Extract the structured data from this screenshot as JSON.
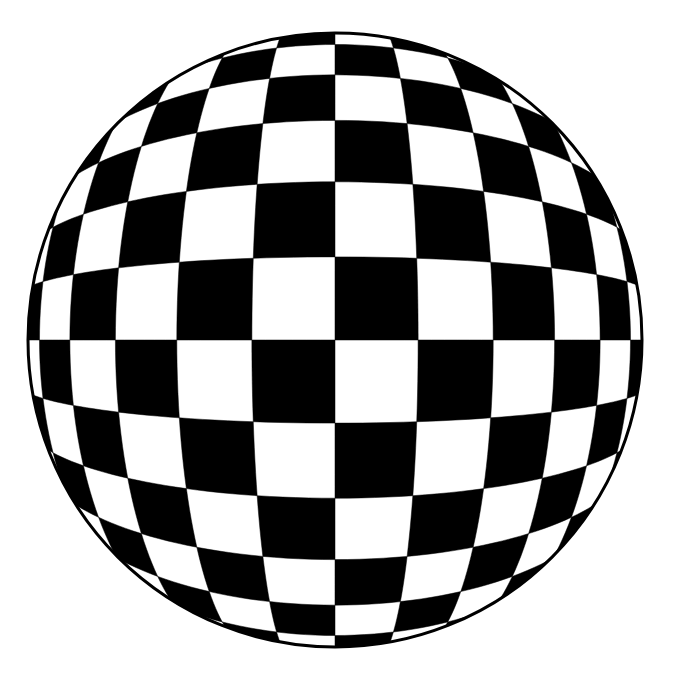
{
  "figure": {
    "title": "Distorted checkerboard test pattern",
    "type": "optical-test-chart",
    "canvas": {
      "width": 677,
      "height": 679,
      "background_color": "#ffffff"
    },
    "circle": {
      "center_x": 335,
      "center_y": 340,
      "radius": 307,
      "outline_color": "#000000",
      "outline_width": 3,
      "fill_color": "#ffffff"
    },
    "checker": {
      "columns": 12,
      "rows": 12,
      "dark_color": "#000000",
      "light_color": "#ffffff",
      "parity_offset": 0,
      "distortion_model": "pincushion",
      "distortion_k": 0.62,
      "half_extent": 1.0
    },
    "measured_column_edges_x": [
      28,
      123,
      192,
      249,
      297,
      335,
      375,
      428,
      487,
      555,
      642
    ],
    "measured_row_edges_y": [
      32,
      128,
      196,
      251,
      298,
      340,
      382,
      432,
      489,
      556,
      648
    ],
    "measured_center_cell_width": 40,
    "measured_edge_cell_width": 95
  },
  "chart_data": {
    "type": "heatmap",
    "title": "Distorted checkerboard test pattern",
    "xlabel": "",
    "ylabel": "",
    "categories": [
      "c1",
      "c2",
      "c3",
      "c4",
      "c5",
      "c6",
      "c7",
      "c8",
      "c9",
      "c10",
      "c11",
      "c12"
    ],
    "grid": true,
    "legend": "none",
    "values": [
      [
        0,
        1,
        0,
        1,
        0,
        1,
        0,
        1,
        0,
        1,
        0,
        1
      ],
      [
        1,
        0,
        1,
        0,
        1,
        0,
        1,
        0,
        1,
        0,
        1,
        0
      ],
      [
        0,
        1,
        0,
        1,
        0,
        1,
        0,
        1,
        0,
        1,
        0,
        1
      ],
      [
        1,
        0,
        1,
        0,
        1,
        0,
        1,
        0,
        1,
        0,
        1,
        0
      ],
      [
        0,
        1,
        0,
        1,
        0,
        1,
        0,
        1,
        0,
        1,
        0,
        1
      ],
      [
        1,
        0,
        1,
        0,
        1,
        0,
        1,
        0,
        1,
        0,
        1,
        0
      ],
      [
        0,
        1,
        0,
        1,
        0,
        1,
        0,
        1,
        0,
        1,
        0,
        1
      ],
      [
        1,
        0,
        1,
        0,
        1,
        0,
        1,
        0,
        1,
        0,
        1,
        0
      ],
      [
        0,
        1,
        0,
        1,
        0,
        1,
        0,
        1,
        0,
        1,
        0,
        1
      ],
      [
        1,
        0,
        1,
        0,
        1,
        0,
        1,
        0,
        1,
        0,
        1,
        0
      ],
      [
        0,
        1,
        0,
        1,
        0,
        1,
        0,
        1,
        0,
        1,
        0,
        1
      ],
      [
        1,
        0,
        1,
        0,
        1,
        0,
        1,
        0,
        1,
        0,
        1,
        0
      ]
    ]
  }
}
